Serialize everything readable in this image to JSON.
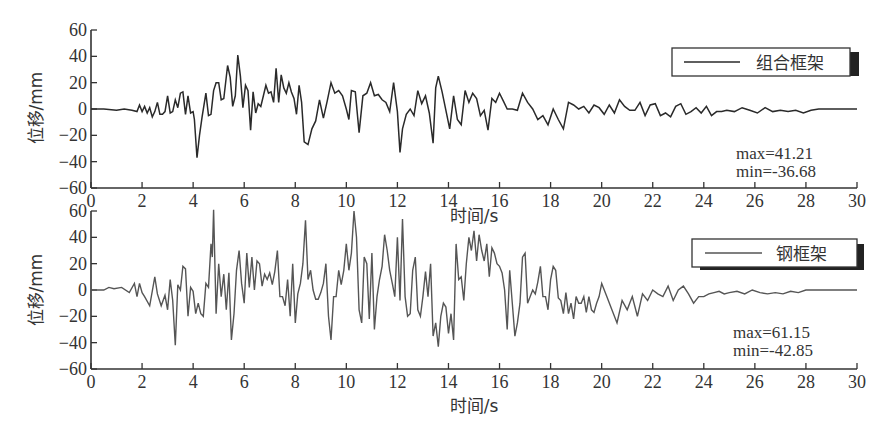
{
  "chart_data": [
    {
      "type": "line",
      "title": "",
      "xlabel": "时间/s",
      "ylabel": "位移/mm",
      "xlim": [
        0,
        30
      ],
      "ylim": [
        -60,
        60
      ],
      "xticks": [
        0,
        2,
        4,
        6,
        8,
        10,
        12,
        14,
        16,
        18,
        20,
        22,
        24,
        26,
        28,
        30
      ],
      "yticks": [
        60,
        40,
        20,
        0,
        -20,
        -40,
        -60
      ],
      "grid": false,
      "legend": {
        "position": "upper right",
        "entries": [
          "组合框架"
        ]
      },
      "annotations": [
        "max=41.21",
        "min=-36.68"
      ],
      "series": [
        {
          "name": "组合框架",
          "color": "#2a2a2a",
          "x": [
            0,
            0.5,
            1,
            1.3,
            1.6,
            1.8,
            1.9,
            2.0,
            2.1,
            2.2,
            2.3,
            2.4,
            2.5,
            2.6,
            2.7,
            2.8,
            2.9,
            3.0,
            3.1,
            3.2,
            3.3,
            3.4,
            3.5,
            3.6,
            3.7,
            3.8,
            3.9,
            4.0,
            4.05,
            4.15,
            4.25,
            4.35,
            4.5,
            4.6,
            4.7,
            4.8,
            4.9,
            5.0,
            5.1,
            5.2,
            5.35,
            5.45,
            5.55,
            5.65,
            5.75,
            5.85,
            5.95,
            6.05,
            6.15,
            6.25,
            6.35,
            6.45,
            6.55,
            6.65,
            6.75,
            6.85,
            6.95,
            7.05,
            7.15,
            7.25,
            7.35,
            7.45,
            7.55,
            7.65,
            7.75,
            7.85,
            7.95,
            8.05,
            8.15,
            8.25,
            8.35,
            8.5,
            8.65,
            8.8,
            8.95,
            9.1,
            9.25,
            9.4,
            9.55,
            9.7,
            9.85,
            10.0,
            10.1,
            10.2,
            10.35,
            10.5,
            10.65,
            10.8,
            10.95,
            11.1,
            11.25,
            11.4,
            11.55,
            11.7,
            11.85,
            12.0,
            12.1,
            12.2,
            12.35,
            12.5,
            12.65,
            12.8,
            12.95,
            13.1,
            13.25,
            13.4,
            13.5,
            13.6,
            13.75,
            13.9,
            14.05,
            14.2,
            14.35,
            14.5,
            14.65,
            14.8,
            14.95,
            15.1,
            15.25,
            15.4,
            15.55,
            15.7,
            15.85,
            16.0,
            16.15,
            16.3,
            16.5,
            16.7,
            16.9,
            17.1,
            17.3,
            17.5,
            17.7,
            17.9,
            18.1,
            18.3,
            18.5,
            18.7,
            18.9,
            19.1,
            19.3,
            19.5,
            19.7,
            19.9,
            20.1,
            20.3,
            20.5,
            20.7,
            20.9,
            21.1,
            21.3,
            21.5,
            21.7,
            21.9,
            22.1,
            22.3,
            22.5,
            22.7,
            22.9,
            23.1,
            23.3,
            23.5,
            23.7,
            23.9,
            24.1,
            24.3,
            24.5,
            24.7,
            24.9,
            25.2,
            25.5,
            25.8,
            26.1,
            26.4,
            26.7,
            27.0,
            27.3,
            27.6,
            27.9,
            28.2,
            28.5,
            28.8,
            29.1,
            29.4,
            29.7,
            30
          ],
          "y": [
            0,
            0,
            -1,
            0,
            -1,
            -2,
            3,
            -2,
            2,
            -3,
            1,
            -6,
            -2,
            5,
            -4,
            -4,
            -2,
            10,
            -3,
            -2,
            7,
            1,
            12,
            13,
            -4,
            10,
            -3,
            -2,
            -8,
            -37,
            -20,
            -6,
            12,
            -5,
            -4,
            14,
            20,
            20,
            7,
            8,
            33,
            24,
            2,
            10,
            41,
            25,
            1,
            18,
            14,
            -16,
            13,
            -3,
            4,
            2,
            10,
            18,
            12,
            13,
            5,
            31,
            5,
            26,
            16,
            12,
            20,
            13,
            8,
            -4,
            18,
            5,
            -25,
            -27,
            -15,
            -9,
            7,
            -7,
            6,
            20,
            12,
            14,
            10,
            0,
            -8,
            14,
            13,
            -18,
            10,
            12,
            20,
            10,
            11,
            7,
            5,
            -2,
            20,
            -2,
            -33,
            -15,
            -4,
            0,
            -5,
            14,
            4,
            10,
            -3,
            -26,
            16,
            25,
            13,
            -1,
            -15,
            10,
            -8,
            -12,
            14,
            5,
            12,
            8,
            -5,
            -1,
            -16,
            8,
            5,
            12,
            6,
            0,
            0,
            -1,
            12,
            5,
            0,
            -8,
            -5,
            -12,
            0,
            -8,
            -15,
            5,
            3,
            0,
            2,
            -3,
            3,
            1,
            -4,
            3,
            -3,
            7,
            2,
            -1,
            -1,
            5,
            -5,
            3,
            4,
            -5,
            -3,
            -6,
            2,
            4,
            -4,
            -2,
            1,
            -3,
            2,
            -5,
            -2,
            -2,
            -1,
            -2,
            1,
            -1,
            -3,
            1,
            -2,
            -1,
            -2,
            -1,
            -3,
            -1
          ],
          "max": 41.21,
          "min": -36.68
        }
      ]
    },
    {
      "type": "line",
      "title": "",
      "xlabel": "时间/s",
      "ylabel": "位移/mm",
      "xlim": [
        0,
        30
      ],
      "ylim": [
        -60,
        60
      ],
      "xticks": [
        0,
        2,
        4,
        6,
        8,
        10,
        12,
        14,
        16,
        18,
        20,
        22,
        24,
        26,
        28,
        30
      ],
      "yticks": [
        60,
        40,
        20,
        0,
        -20,
        -40,
        -60
      ],
      "grid": false,
      "legend": {
        "position": "upper right",
        "entries": [
          "钢框架"
        ]
      },
      "annotations": [
        "max=61.15",
        "min=-42.85"
      ],
      "series": [
        {
          "name": "钢框架",
          "color": "#555555",
          "x": [
            0,
            0.5,
            0.7,
            0.9,
            1.2,
            1.5,
            1.7,
            1.8,
            1.9,
            2.0,
            2.1,
            2.3,
            2.5,
            2.6,
            2.75,
            2.9,
            3.0,
            3.1,
            3.2,
            3.3,
            3.4,
            3.5,
            3.6,
            3.7,
            3.8,
            3.9,
            4.0,
            4.1,
            4.2,
            4.3,
            4.4,
            4.5,
            4.6,
            4.7,
            4.75,
            4.8,
            4.9,
            5.0,
            5.1,
            5.2,
            5.3,
            5.4,
            5.5,
            5.6,
            5.7,
            5.8,
            5.9,
            6.0,
            6.1,
            6.2,
            6.3,
            6.4,
            6.5,
            6.6,
            6.7,
            6.8,
            6.9,
            7.0,
            7.1,
            7.2,
            7.3,
            7.4,
            7.5,
            7.6,
            7.7,
            7.8,
            7.9,
            8.0,
            8.1,
            8.2,
            8.3,
            8.4,
            8.5,
            8.6,
            8.7,
            8.8,
            8.9,
            9.0,
            9.1,
            9.2,
            9.3,
            9.4,
            9.5,
            9.6,
            9.7,
            9.8,
            9.9,
            10.0,
            10.1,
            10.2,
            10.3,
            10.4,
            10.5,
            10.6,
            10.7,
            10.8,
            10.9,
            11.0,
            11.1,
            11.2,
            11.3,
            11.4,
            11.5,
            11.6,
            11.7,
            11.8,
            11.9,
            12.0,
            12.1,
            12.2,
            12.3,
            12.4,
            12.5,
            12.6,
            12.7,
            12.8,
            12.9,
            13.0,
            13.1,
            13.2,
            13.3,
            13.4,
            13.5,
            13.6,
            13.7,
            13.8,
            13.9,
            14.0,
            14.1,
            14.2,
            14.3,
            14.4,
            14.5,
            14.6,
            14.7,
            14.8,
            14.9,
            15.0,
            15.1,
            15.2,
            15.3,
            15.4,
            15.5,
            15.6,
            15.7,
            15.8,
            15.9,
            16.0,
            16.1,
            16.2,
            16.3,
            16.4,
            16.5,
            16.6,
            16.7,
            16.8,
            16.9,
            17.0,
            17.1,
            17.2,
            17.3,
            17.4,
            17.5,
            17.6,
            17.7,
            17.8,
            17.9,
            18.0,
            18.1,
            18.2,
            18.3,
            18.4,
            18.5,
            18.6,
            18.7,
            18.8,
            18.9,
            19.0,
            19.1,
            19.2,
            19.3,
            19.4,
            19.5,
            19.6,
            19.7,
            19.8,
            19.9,
            20.0,
            20.2,
            20.4,
            20.6,
            20.8,
            21.0,
            21.2,
            21.4,
            21.6,
            21.8,
            22.0,
            22.2,
            22.4,
            22.6,
            22.8,
            23.0,
            23.2,
            23.4,
            23.6,
            23.8,
            23.9,
            24.0,
            24.2,
            24.4,
            24.6,
            24.8,
            25.0,
            25.3,
            25.6,
            25.9,
            26.2,
            26.5,
            26.8,
            27.1,
            27.4,
            27.7,
            28.0,
            28.3,
            28.6,
            28.9,
            29.2,
            29.5,
            29.8,
            30
          ],
          "y": [
            0,
            0,
            2,
            1,
            2,
            -2,
            5,
            -5,
            5,
            -2,
            -5,
            -12,
            10,
            -3,
            -12,
            -4,
            -15,
            8,
            -8,
            -42,
            4,
            0,
            18,
            16,
            -20,
            2,
            -1,
            -18,
            -10,
            -18,
            -20,
            5,
            2,
            35,
            25,
            61,
            -18,
            20,
            -5,
            12,
            -15,
            13,
            -38,
            -18,
            15,
            30,
            5,
            -10,
            28,
            2,
            25,
            0,
            22,
            20,
            3,
            12,
            8,
            13,
            4,
            14,
            30,
            -5,
            -5,
            -12,
            8,
            -20,
            20,
            -25,
            -3,
            5,
            20,
            53,
            8,
            15,
            0,
            -7,
            -7,
            -2,
            5,
            20,
            -20,
            -38,
            -5,
            -5,
            15,
            4,
            15,
            35,
            15,
            28,
            60,
            40,
            -15,
            -25,
            25,
            20,
            -22,
            28,
            -30,
            -5,
            8,
            18,
            42,
            30,
            15,
            5,
            -5,
            40,
            -8,
            54,
            -5,
            -20,
            -18,
            15,
            25,
            -15,
            -20,
            -5,
            14,
            -5,
            20,
            -35,
            -25,
            -43,
            -20,
            -10,
            -13,
            -33,
            -18,
            -38,
            35,
            8,
            10,
            -8,
            20,
            40,
            30,
            45,
            22,
            42,
            30,
            22,
            35,
            10,
            32,
            28,
            20,
            18,
            13,
            0,
            -30,
            15,
            -10,
            -35,
            -25,
            -10,
            25,
            28,
            -10,
            -5,
            0,
            -3,
            6,
            18,
            -5,
            -5,
            -15,
            8,
            18,
            15,
            -6,
            -8,
            -18,
            -2,
            -18,
            -10,
            -22,
            -5,
            -10,
            -10,
            -5,
            -17,
            -5,
            -15,
            -17,
            -10,
            -5,
            5,
            -5,
            -15,
            -25,
            -8,
            -15,
            -5,
            -20,
            -3,
            -8,
            0,
            -3,
            -5,
            3,
            -8,
            0,
            3,
            -3,
            -10,
            -5,
            -5,
            -5,
            -3,
            -2,
            -1,
            -3,
            -2,
            -1,
            -3,
            0,
            -2,
            -3,
            -2,
            -3,
            -1,
            -2
          ],
          "max": 61.15,
          "min": -42.85
        }
      ]
    }
  ],
  "figure": {
    "panels": [
      {
        "legend_label": "组合框架",
        "stat_max": "max=41.21",
        "stat_min": "min=-36.68",
        "xlabel": "时间/s",
        "ylabel": "位移/mm"
      },
      {
        "legend_label": "钢框架",
        "stat_max": "max=61.15",
        "stat_min": "min=-42.85",
        "xlabel": "时间/s",
        "ylabel": "位移/mm"
      }
    ]
  }
}
